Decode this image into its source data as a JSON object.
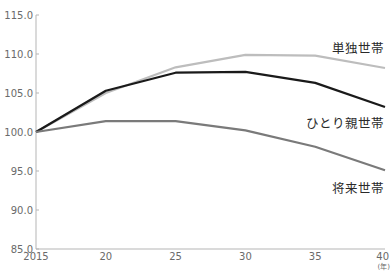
{
  "chart_data": {
    "type": "line",
    "title": "",
    "xlabel": "",
    "ylabel": "",
    "x_unit_label": "(年)",
    "x": [
      2015,
      2020,
      2025,
      2030,
      2035,
      2040
    ],
    "x_tick_labels": [
      "2015",
      "20",
      "25",
      "30",
      "35",
      "40"
    ],
    "y_tick_labels": [
      "85.0",
      "90.0",
      "95.0",
      "100.0",
      "105.0",
      "110.0",
      "115.0"
    ],
    "y_ticks": [
      85,
      90,
      95,
      100,
      105,
      110,
      115
    ],
    "ylim": [
      85,
      115
    ],
    "grid": false,
    "legend_position": "inline-right",
    "series": [
      {
        "name": "単独世帯",
        "color": "#bdbdbd",
        "values": [
          100.0,
          105.0,
          108.3,
          109.9,
          109.8,
          108.2
        ]
      },
      {
        "name": "ひとり親世帯",
        "color": "#1a1a1a",
        "values": [
          100.0,
          105.3,
          107.6,
          107.7,
          106.3,
          103.2
        ]
      },
      {
        "name": "将来世帯",
        "color": "#7a7a7a",
        "values": [
          100.0,
          101.4,
          101.4,
          100.2,
          98.1,
          95.1
        ]
      }
    ]
  }
}
